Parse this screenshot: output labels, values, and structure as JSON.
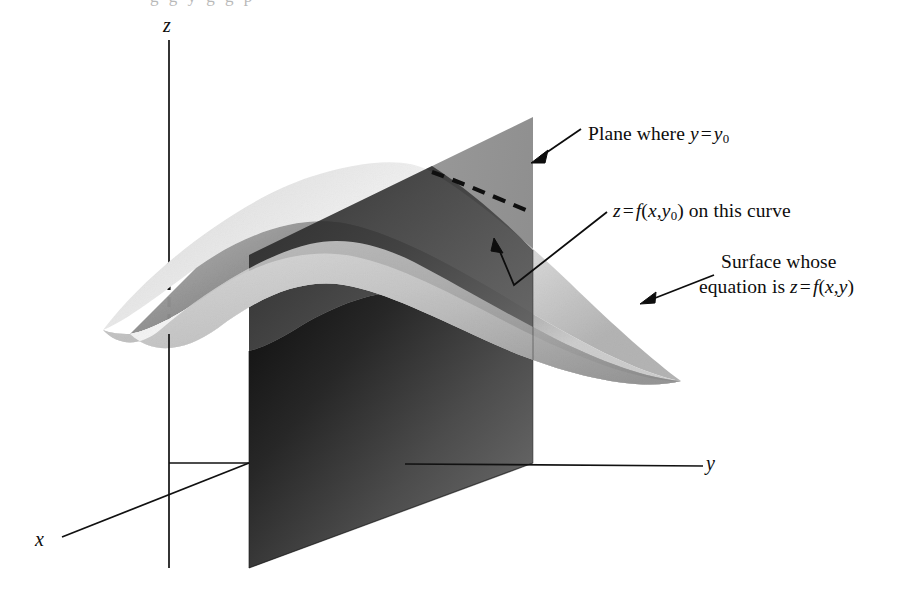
{
  "figure": {
    "kind": "3d-surface-diagram",
    "background_color": "#ffffff",
    "ink_color": "#111111"
  },
  "axes": {
    "x_label": "x",
    "y_label": "y",
    "z_label": "z",
    "origin": {
      "x": 249,
      "y": 463
    },
    "z_axis": {
      "from": {
        "x": 169,
        "y": 40
      },
      "to": {
        "x": 169,
        "y": 568
      },
      "hidden_from_y": 263,
      "hidden_to_y": 333
    },
    "y_axis": {
      "from": {
        "x": 169,
        "y": 463
      },
      "to": {
        "x": 703,
        "y": 466
      }
    },
    "x_axis": {
      "from": {
        "x": 249,
        "y": 463
      },
      "to": {
        "x": 62,
        "y": 537
      }
    }
  },
  "annotations": [
    {
      "id": "plane-label",
      "text_plain": "Plane where y = y0",
      "lead": "Plane where ",
      "var1": "y",
      "operator": "=",
      "var2": "y",
      "subscript": "0",
      "arrow_from": {
        "x": 578,
        "y": 131
      },
      "arrow_to": {
        "x": 534,
        "y": 161
      }
    },
    {
      "id": "curve-label",
      "text_plain": "z = f(x, y0) on this curve",
      "var_z": "z",
      "operator": "=",
      "func": "f",
      "args_open": "(",
      "arg1": "x",
      "comma": ",",
      "arg2": "y",
      "subscript": "0",
      "args_close": ")",
      "tail": " on this curve",
      "arrow_from": {
        "x": 606,
        "y": 213
      },
      "arrow_bend": {
        "x": 513,
        "y": 286
      },
      "arrow_to": {
        "x": 494,
        "y": 241
      }
    },
    {
      "id": "surface-label",
      "line1": "Surface whose",
      "line2_lead": "equation is ",
      "var_z": "z",
      "operator": "=",
      "func": "f",
      "args_open": "(",
      "arg1": "x",
      "comma": ",",
      "arg2": "y",
      "args_close": ")",
      "arrow_from": {
        "x": 712,
        "y": 277
      },
      "arrow_to": {
        "x": 641,
        "y": 303
      }
    }
  ],
  "shapes": {
    "surface": {
      "name": "saddle-surface",
      "fill_light": "#efefef",
      "fill_mid": "#c9c9c9",
      "fill_dark": "#8f8f8f",
      "left_tip": {
        "x": 103,
        "y": 330
      },
      "crest": {
        "x": 420,
        "y": 163
      },
      "right_tip": {
        "x": 681,
        "y": 381
      }
    },
    "plane": {
      "name": "cutting-plane",
      "fill_dark": "#1c1c1c",
      "fill_mid": "#5a5a5a",
      "fill_light": "#9a9a9a",
      "left_edge_x": 249,
      "right_edge_x": 533,
      "top_right": {
        "x": 533,
        "y": 117
      },
      "bottom_left": {
        "x": 249,
        "y": 568
      },
      "bottom_right": {
        "x": 533,
        "y": 463
      }
    },
    "trace_curve": {
      "name": "intersection-trace",
      "style": "dashed",
      "from": {
        "x": 432,
        "y": 172
      },
      "to": {
        "x": 533,
        "y": 213
      }
    }
  },
  "page_bleed": {
    "top_text": "g g y g g p"
  }
}
